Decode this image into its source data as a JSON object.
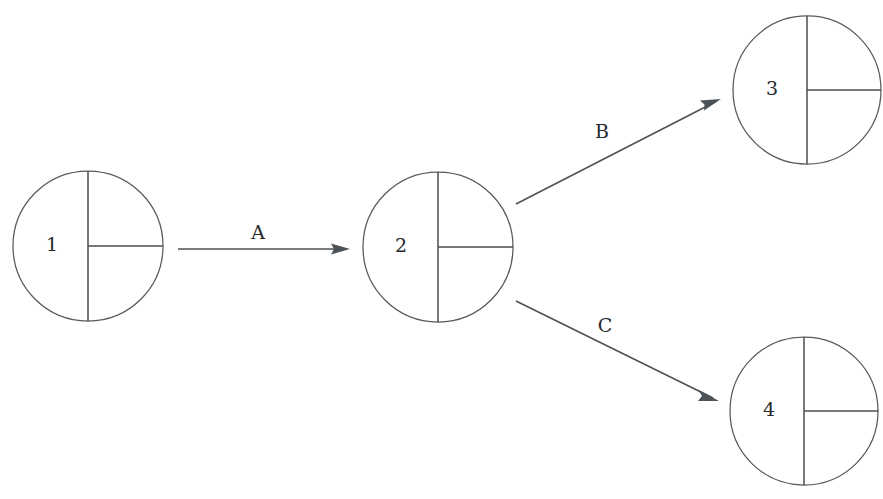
{
  "diagram": {
    "type": "node-link-graph",
    "canvas": {
      "width": 883,
      "height": 499,
      "background": "#ffffff"
    },
    "style": {
      "node_stroke": "#555a5e",
      "divider_stroke": "#4a4f53",
      "edge_stroke": "#4d5256",
      "text_color": "#26292c"
    },
    "nodes": [
      {
        "id": "1",
        "label": "1",
        "cx": 88,
        "cy": 246,
        "r": 75,
        "label_x": 52,
        "label_y": 246,
        "glyph": "circle-with-vertical-diameter-and-right-radius"
      },
      {
        "id": "2",
        "label": "2",
        "cx": 438,
        "cy": 247,
        "r": 75,
        "label_x": 401,
        "label_y": 247,
        "glyph": "circle-with-vertical-diameter-and-right-radius"
      },
      {
        "id": "3",
        "label": "3",
        "cx": 807,
        "cy": 90,
        "r": 74,
        "label_x": 772,
        "label_y": 90,
        "glyph": "circle-with-vertical-diameter-and-right-radius"
      },
      {
        "id": "4",
        "label": "4",
        "cx": 804,
        "cy": 411,
        "r": 74,
        "label_x": 769,
        "label_y": 411,
        "glyph": "circle-with-vertical-diameter-and-right-radius"
      }
    ],
    "edges": [
      {
        "id": "A",
        "label": "A",
        "from": "1",
        "to": "2",
        "x1": 178,
        "y1": 249,
        "x2": 350,
        "y2": 249,
        "label_x": 258,
        "label_y": 234
      },
      {
        "id": "B",
        "label": "B",
        "from": "2",
        "to": "3",
        "x1": 516,
        "y1": 204,
        "x2": 721,
        "y2": 99,
        "label_x": 602,
        "label_y": 133
      },
      {
        "id": "C",
        "label": "C",
        "from": "2",
        "to": "4",
        "x1": 516,
        "y1": 301,
        "x2": 719,
        "y2": 401,
        "label_x": 605,
        "label_y": 327
      }
    ]
  }
}
